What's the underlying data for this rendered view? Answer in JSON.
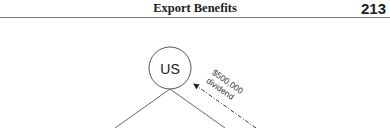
{
  "header": {
    "title": "Export Benefits",
    "page_number": "213"
  },
  "diagram": {
    "nodes": [
      {
        "id": "us",
        "label": "US",
        "shape": "circle"
      }
    ],
    "edges": [
      {
        "from": "us",
        "to": "lower-left",
        "style": "solid"
      },
      {
        "from": "us",
        "to": "lower-right",
        "style": "solid"
      },
      {
        "from": "lower-right",
        "to": "us",
        "style": "dash-dot",
        "arrow": "end",
        "label_line1": "$500,000",
        "label_line2": "dividend"
      }
    ]
  }
}
